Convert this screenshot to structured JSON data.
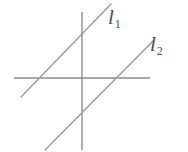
{
  "figure": {
    "background_color": "#ffffff",
    "stroke_color": "#8d8d8d",
    "label_color": "#4c4c4c",
    "width": 188,
    "height": 152
  },
  "axes": {
    "x_axis": {
      "name": "horizontal-axis",
      "x1": 14,
      "y1": 78,
      "x2": 150,
      "y2": 78
    },
    "y_axis": {
      "name": "vertical-axis",
      "x1": 82,
      "y1": 12,
      "x2": 82,
      "y2": 150
    },
    "origin": {
      "x": 82,
      "y": 78
    }
  },
  "lines": [
    {
      "id": "l1",
      "label_base": "l",
      "label_sub": "1",
      "x1": 21,
      "y1": 97,
      "x2": 111,
      "y2": 4,
      "x_intercept": 38,
      "label_x": 108,
      "label_y": 7
    },
    {
      "id": "l2",
      "label_base": "l",
      "label_sub": "2",
      "x1": 45,
      "y1": 150,
      "x2": 153,
      "y2": 41,
      "x_intercept": 112,
      "label_x": 150,
      "label_y": 34
    }
  ],
  "chart_data": {
    "type": "line",
    "title": "",
    "xlabel": "",
    "ylabel": "",
    "grid": false,
    "legend": "none",
    "series": [
      {
        "name": "l1",
        "x": [
          -6.1,
          0,
          2.9
        ],
        "y": [
          -1.9,
          4.0,
          7.4
        ]
      },
      {
        "name": "l2",
        "x": [
          -3.7,
          0,
          7.1
        ],
        "y": [
          -7.2,
          -3.4,
          3.7
        ]
      }
    ],
    "xlim": [
      -6.8,
      6.8
    ],
    "ylim": [
      -7.2,
      6.6
    ]
  }
}
